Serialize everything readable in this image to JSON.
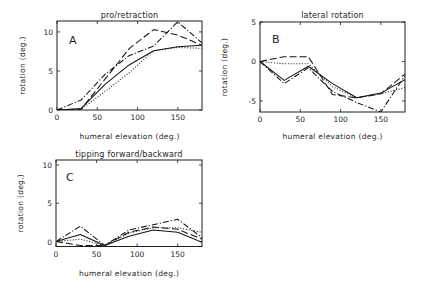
{
  "figure": {
    "panel_count": 3
  },
  "chart_data": [
    {
      "panel": "A",
      "type": "line",
      "title": "pro/retraction",
      "xlabel": "humeral elevation (deg.)",
      "ylabel": "rotation (deg.)",
      "xlim": [
        0,
        180
      ],
      "ylim": [
        0,
        11.4
      ],
      "xticks": [
        "0",
        "50",
        "100",
        "150"
      ],
      "yticks": [
        "0",
        "5",
        "10"
      ],
      "grid": false,
      "legend": null,
      "x": [
        0,
        30,
        60,
        90,
        120,
        150,
        180
      ],
      "series": [
        {
          "name": "solid",
          "style": "solid",
          "values": [
            0,
            0.2,
            3.3,
            5.8,
            7.6,
            8.1,
            8.3
          ]
        },
        {
          "name": "dotted",
          "style": "dotted",
          "values": [
            0,
            0.1,
            2.4,
            4.8,
            7.6,
            8.0,
            7.9
          ]
        },
        {
          "name": "dashed",
          "style": "dashed",
          "values": [
            0,
            0.1,
            4.0,
            7.9,
            10.3,
            9.6,
            8.3
          ]
        },
        {
          "name": "dash-dot",
          "style": "dash-dot",
          "values": [
            0,
            1.3,
            4.6,
            7.0,
            8.2,
            11.3,
            8.6
          ]
        }
      ]
    },
    {
      "panel": "B",
      "type": "line",
      "title": "lateral rotation",
      "xlabel": "humeral elevation (deg.)",
      "ylabel": "rotation (deg.)",
      "xlim": [
        0,
        180
      ],
      "ylim": [
        -6.4,
        5
      ],
      "xticks": [
        "0",
        "50",
        "100",
        "150"
      ],
      "yticks": [
        "-5",
        "0",
        "5"
      ],
      "grid": false,
      "legend": null,
      "x": [
        0,
        30,
        60,
        90,
        120,
        150,
        180
      ],
      "series": [
        {
          "name": "solid",
          "style": "solid",
          "values": [
            0,
            -2.4,
            -0.6,
            -2.8,
            -4.6,
            -4.0,
            -2.3
          ]
        },
        {
          "name": "dotted",
          "style": "dotted",
          "values": [
            0,
            -0.3,
            -0.3,
            -3.2,
            -4.6,
            -4.1,
            -3.3
          ]
        },
        {
          "name": "dashed",
          "style": "dashed",
          "values": [
            0,
            0.6,
            0.6,
            -4.2,
            -4.6,
            -4.1,
            -1.6
          ]
        },
        {
          "name": "dash-dot",
          "style": "dash-dot",
          "values": [
            0,
            -2.8,
            -0.8,
            -3.8,
            -5.2,
            -6.4,
            -1.8
          ]
        }
      ]
    },
    {
      "panel": "C",
      "type": "line",
      "title": "tipping forward/backward",
      "xlabel": "humeral elevation (deg.)",
      "ylabel": "rotation (deg.)",
      "xlim": [
        0,
        180
      ],
      "ylim": [
        -0.65,
        10.65
      ],
      "xticks": [
        "0",
        "50",
        "100",
        "150"
      ],
      "yticks": [
        "0",
        "5",
        "10"
      ],
      "grid": false,
      "legend": null,
      "x": [
        0,
        30,
        60,
        90,
        120,
        150,
        180
      ],
      "series": [
        {
          "name": "solid",
          "style": "solid",
          "values": [
            0,
            0.9,
            -0.5,
            0.7,
            1.5,
            1.2,
            -0.1
          ]
        },
        {
          "name": "dotted",
          "style": "dotted",
          "values": [
            0,
            0.3,
            -0.5,
            1.1,
            1.8,
            1.8,
            1.2
          ]
        },
        {
          "name": "dashed",
          "style": "dashed",
          "values": [
            0,
            -0.5,
            -0.5,
            1.2,
            1.9,
            1.6,
            0.3
          ]
        },
        {
          "name": "dash-dot",
          "style": "dash-dot",
          "values": [
            0,
            2.0,
            -0.5,
            1.5,
            2.2,
            2.9,
            0.5
          ]
        }
      ]
    }
  ]
}
